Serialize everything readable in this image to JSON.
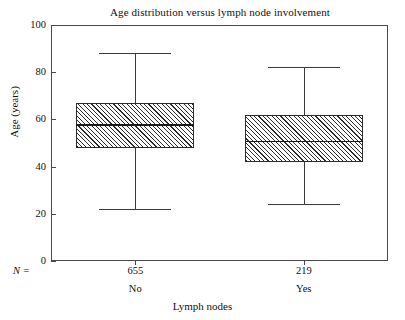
{
  "chart_data": {
    "type": "box",
    "title": "Age distribution versus lymph node involvement",
    "xlabel": "Lymph nodes",
    "ylabel": "Age (years)",
    "ylim": [
      0,
      100
    ],
    "yticks": [
      0,
      20,
      40,
      60,
      80,
      100
    ],
    "ytick_labels": [
      "0",
      "20",
      "40",
      "60",
      "80",
      "100"
    ],
    "grid": false,
    "legend": "none",
    "n_prefix": "N =",
    "categories": [
      "No",
      "Yes"
    ],
    "counts": [
      655,
      219
    ],
    "count_labels": [
      "655",
      "219"
    ],
    "boxes": [
      {
        "category": "No",
        "n": 655,
        "n_label": "655",
        "whisker_low": 22,
        "q1": 48,
        "median": 58,
        "q3": 67,
        "whisker_high": 88
      },
      {
        "category": "Yes",
        "n": 219,
        "n_label": "219",
        "whisker_low": 24,
        "q1": 42,
        "median": 51,
        "q3": 62,
        "whisker_high": 82
      }
    ],
    "colors": {
      "frame": "#4a4a4a",
      "box_outline": "#2b2b2b",
      "box_fill": "#ffffff",
      "hatch": "#2b2b2b",
      "median": "#1a1a1a",
      "whisker": "#3a3a3a",
      "background": "#ffffff",
      "text": "#111111"
    }
  }
}
